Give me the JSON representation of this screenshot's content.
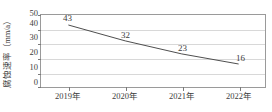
{
  "chart_data": {
    "type": "line",
    "title": "",
    "xlabel": "",
    "ylabel": "腐蚀速率（mm/a）",
    "categories": [
      "2019年",
      "2020年",
      "2021年",
      "2022年"
    ],
    "values": [
      43,
      32,
      23,
      16
    ],
    "point_labels": [
      "43",
      "32",
      "23",
      "16"
    ],
    "ylim": [
      0,
      50
    ],
    "y_ticks": [
      "0",
      "10",
      "20",
      "30",
      "40",
      "50"
    ],
    "y_tick_values": [
      0,
      10,
      20,
      30,
      40,
      50
    ],
    "grid": "horizontal",
    "legend": "none",
    "line_color": "#4a4a4a",
    "frame_color": "#9a9a9a",
    "gridline_color": "#d8d8d8",
    "text_color": "#3d3d3d"
  }
}
